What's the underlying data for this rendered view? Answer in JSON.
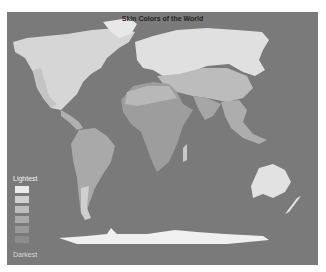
{
  "map": {
    "title": "Skin Colors of the World",
    "background_color": "#7a7a7a",
    "legend": {
      "top_label": "Lightest",
      "bottom_label": "Darkest",
      "swatches": [
        "#ececec",
        "#cfcfcf",
        "#bdbdbd",
        "#aaaaaa",
        "#999999",
        "#8c8c8c"
      ]
    },
    "regions": [
      {
        "name": "North America (north)",
        "shade": "#d9d9d9"
      },
      {
        "name": "Europe / Russia",
        "shade": "#e2e2e2"
      },
      {
        "name": "Central Asia",
        "shade": "#bfbfbf"
      },
      {
        "name": "South Asia",
        "shade": "#a8a8a8"
      },
      {
        "name": "Africa",
        "shade": "#9c9c9c"
      },
      {
        "name": "South America",
        "shade": "#a9a9a9"
      },
      {
        "name": "Australia",
        "shade": "#e4e4e4"
      },
      {
        "name": "Antarctica",
        "shade": "#f0f0f0"
      }
    ]
  }
}
